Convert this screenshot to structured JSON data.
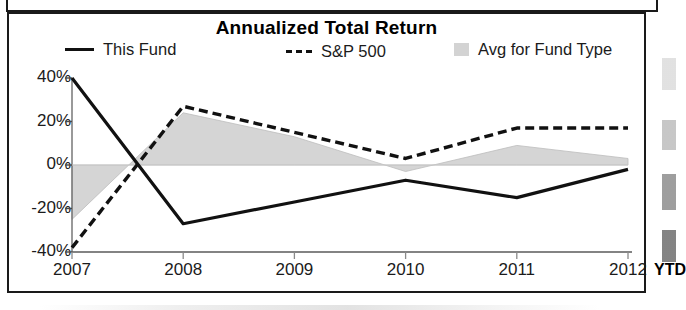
{
  "panel": {
    "title": "Annualized Total Return"
  },
  "legend": {
    "items": [
      {
        "label": "This Fund",
        "marker": "solid-line-swatch",
        "color": "#111111"
      },
      {
        "label": "S&P 500",
        "marker": "dashed-line-swatch",
        "color": "#111111"
      },
      {
        "label": "Avg for Fund Type",
        "marker": "area-swatch",
        "color": "#d3d3d3"
      }
    ]
  },
  "axis": {
    "y_ticks": [
      "40%",
      "20%",
      "0%",
      "-20%",
      "-40%"
    ],
    "x_ticks": [
      "2007",
      "2008",
      "2009",
      "2010",
      "2011",
      "2012"
    ],
    "x_suffix": "YTD"
  },
  "chart_data": {
    "type": "line",
    "title": "Annualized Total Return",
    "xlabel": "",
    "ylabel": "",
    "x": [
      "2007",
      "2008",
      "2009",
      "2010",
      "2011",
      "2012"
    ],
    "categories": [
      "2007",
      "2008",
      "2009",
      "2010",
      "2011",
      "2012"
    ],
    "ylim": [
      -40,
      40
    ],
    "ytick_values": [
      40,
      20,
      0,
      -20,
      -40
    ],
    "ytick_labels": [
      "40%",
      "20%",
      "0%",
      "-20%",
      "-40%"
    ],
    "y_unit": "percent",
    "grid": false,
    "zero_line": true,
    "legend_position": "top",
    "x_suffix_note": "YTD",
    "series": [
      {
        "name": "This Fund",
        "style": "solid",
        "color": "#111111",
        "values": [
          40,
          -27,
          -17,
          -7,
          -15,
          -2
        ]
      },
      {
        "name": "S&P 500",
        "style": "dashed",
        "color": "#111111",
        "values": [
          -38,
          27,
          15,
          3,
          17,
          17
        ]
      },
      {
        "name": "Avg for Fund Type",
        "style": "filled-area",
        "color": "#d3d3d3",
        "values": [
          -25,
          24,
          13,
          -3,
          9,
          3
        ]
      }
    ]
  }
}
